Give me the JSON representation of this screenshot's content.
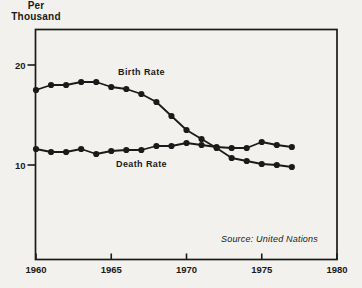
{
  "chart_data": {
    "type": "line",
    "title": "",
    "unit_label": [
      "Per",
      "Thousand"
    ],
    "ylabel": "Per Thousand",
    "xlabel": "",
    "x": [
      1960,
      1961,
      1962,
      1963,
      1964,
      1965,
      1966,
      1967,
      1968,
      1969,
      1970,
      1971,
      1972,
      1973,
      1974,
      1975,
      1976,
      1977
    ],
    "series": [
      {
        "name": "Birth Rate",
        "values": [
          17.5,
          18.0,
          18.0,
          18.3,
          18.3,
          17.8,
          17.6,
          17.1,
          16.3,
          14.9,
          13.5,
          12.6,
          11.7,
          10.7,
          10.4,
          10.1,
          10.0,
          9.8
        ]
      },
      {
        "name": "Death Rate",
        "values": [
          11.6,
          11.3,
          11.3,
          11.6,
          11.1,
          11.4,
          11.5,
          11.5,
          11.9,
          11.9,
          12.2,
          12.0,
          11.8,
          11.7,
          11.7,
          12.3,
          12.0,
          11.8
        ]
      }
    ],
    "x_ticks": [
      1960,
      1965,
      1970,
      1975,
      1980
    ],
    "y_ticks": [
      10,
      20
    ],
    "xlim": [
      1960,
      1980
    ],
    "ylim": [
      0.5,
      23.5
    ],
    "grid": false,
    "markers": true,
    "legend": "inline-labels",
    "source": "Source: United Nations",
    "ink_color": "#1a1a1a",
    "background_color": "#f2f1ed"
  }
}
